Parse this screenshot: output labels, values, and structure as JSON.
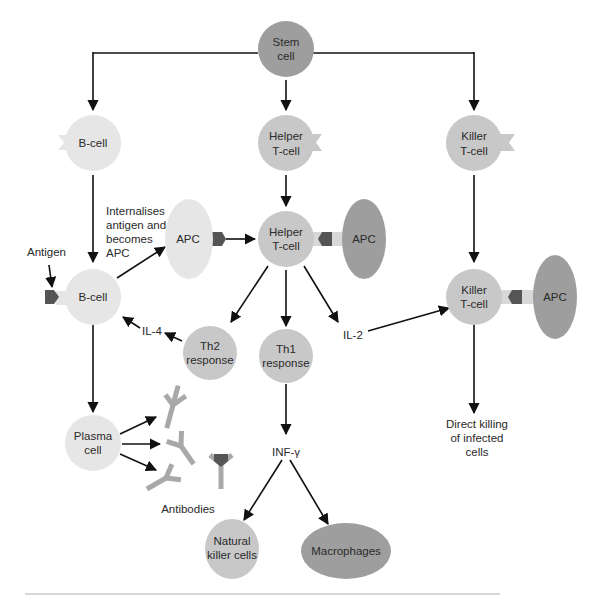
{
  "colors": {
    "dark_cell": "#9e9e9e",
    "medium_cell": "#c8c8c8",
    "light_cell": "#e6e6e6",
    "receptor": "#d8d8d8",
    "antigen": "#555555",
    "antibody": "#a8a8a8",
    "edge": "#111111",
    "footer_rule": "#b0b0b0"
  },
  "nodes": {
    "stem_cell": {
      "line1": "Stem",
      "line2": "cell"
    },
    "b_cell_top": {
      "label": "B-cell"
    },
    "helper_t_top": {
      "line1": "Helper",
      "line2": "T-cell"
    },
    "killer_t_top": {
      "line1": "Killer",
      "line2": "T-cell"
    },
    "apc_left": {
      "label": "APC"
    },
    "helper_t_mid": {
      "line1": "Helper",
      "line2": "T-cell"
    },
    "apc_mid": {
      "label": "APC"
    },
    "killer_t_mid": {
      "line1": "Killer",
      "line2": "T-cell"
    },
    "apc_right": {
      "label": "APC"
    },
    "b_cell_mid": {
      "label": "B-cell"
    },
    "th2": {
      "line1": "Th2",
      "line2": "response"
    },
    "th1": {
      "line1": "Th1",
      "line2": "response"
    },
    "plasma_cell": {
      "line1": "Plasma",
      "line2": "cell"
    },
    "nk_cells": {
      "line1": "Natural",
      "line2": "killer cells"
    },
    "macrophages": {
      "label": "Macrophages"
    }
  },
  "labels": {
    "internalises": [
      "Internalises",
      "antigen and",
      "becomes",
      "APC"
    ],
    "antigen": "Antigen",
    "il4": "IL-4",
    "il2": "IL-2",
    "inf_gamma": "INF-γ",
    "antibodies": "Antibodies",
    "direct_killing": [
      "Direct killing",
      "of infected",
      "cells"
    ]
  }
}
